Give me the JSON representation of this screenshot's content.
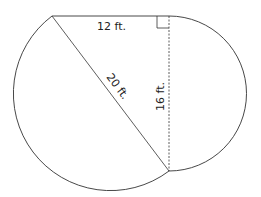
{
  "diagram": {
    "labels": {
      "top": "12 ft.",
      "hypotenuse": "20 ft.",
      "vertical": "16 ft."
    },
    "colors": {
      "stroke": "#333333",
      "background": "#ffffff"
    }
  }
}
